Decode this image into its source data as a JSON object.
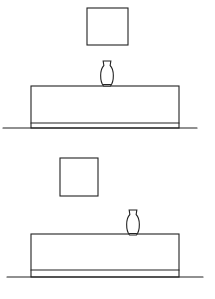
{
  "canvas": {
    "width": 215,
    "height": 299,
    "background": "#ffffff",
    "line_color": "#222222"
  },
  "scenes": [
    {
      "id": "top",
      "picture": {
        "x": 87,
        "y": 8,
        "w": 41,
        "h": 37
      },
      "vase": {
        "cx": 107,
        "top": 61,
        "bottom": 86,
        "w": 14
      },
      "cabinet": {
        "x": 31,
        "y": 86,
        "w": 148,
        "h": 42,
        "plinth_y": 123
      },
      "ground": {
        "x1": 3,
        "x2": 197,
        "y": 128
      }
    },
    {
      "id": "bottom",
      "picture": {
        "x": 60,
        "y": 158,
        "w": 38,
        "h": 38
      },
      "vase": {
        "cx": 133,
        "top": 210,
        "bottom": 235,
        "w": 14
      },
      "cabinet": {
        "x": 31,
        "y": 234,
        "w": 148,
        "h": 43,
        "plinth_y": 270
      },
      "ground": {
        "x1": 7,
        "x2": 203,
        "y": 277
      }
    }
  ]
}
